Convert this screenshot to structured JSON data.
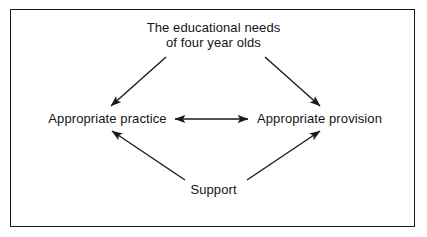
{
  "diagram": {
    "title_node": {
      "name": "educational-needs",
      "lines": [
        "The educational needs",
        "of four year olds"
      ]
    },
    "nodes": [
      {
        "id": "practice",
        "label": "Appropriate practice"
      },
      {
        "id": "provision",
        "label": "Appropriate provision"
      },
      {
        "id": "support",
        "label": "Support"
      }
    ],
    "connectors": [
      {
        "id": "needs-to-practice",
        "from": "educational-needs",
        "to": "practice",
        "style": "single-arrow",
        "direction": "down-left"
      },
      {
        "id": "needs-to-provision",
        "from": "educational-needs",
        "to": "provision",
        "style": "single-arrow",
        "direction": "down-right"
      },
      {
        "id": "practice-provision",
        "from": "practice",
        "to": "provision",
        "style": "double-arrow",
        "direction": "horizontal"
      },
      {
        "id": "support-to-practice",
        "from": "support",
        "to": "practice",
        "style": "single-arrow",
        "direction": "up-left"
      },
      {
        "id": "support-to-provision",
        "from": "support",
        "to": "provision",
        "style": "single-arrow",
        "direction": "up-right"
      }
    ],
    "colors": {
      "ink": "#141414",
      "line": "#1a1a1a",
      "background": "#ffffff"
    }
  }
}
